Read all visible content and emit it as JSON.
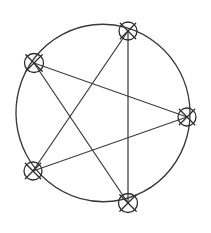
{
  "document": {
    "title": "Pentagram inscribed in circle",
    "background_color": "#ffffff",
    "width": 211,
    "height": 233
  },
  "figure": {
    "type": "geometric-diagram",
    "stroke_color": "#3a3a3a",
    "line_color": "#3f3f3f",
    "marker_color": "#2e2e2e",
    "stroke_width": 1.35,
    "circle": {
      "center_x": 103,
      "center_y": 113,
      "radius": 87
    },
    "vertices": [
      {
        "id": "top",
        "label": "A",
        "x": 128,
        "y": 31,
        "marker_radius": 9,
        "cross_length": 15
      },
      {
        "id": "upper-left",
        "label": "B",
        "x": 34,
        "y": 63,
        "marker_radius": 9.5,
        "cross_length": 16
      },
      {
        "id": "right",
        "label": "C",
        "x": 187,
        "y": 117,
        "marker_radius": 9,
        "cross_length": 15
      },
      {
        "id": "lower-left",
        "label": "D",
        "x": 33,
        "y": 171,
        "marker_radius": 9,
        "cross_length": 15
      },
      {
        "id": "bottom",
        "label": "E",
        "x": 128,
        "y": 203,
        "marker_radius": 9.5,
        "cross_length": 16
      }
    ],
    "chords": [
      {
        "id": "chord-top-to-lower-left",
        "from": "top",
        "to": "lower-left"
      },
      {
        "id": "chord-lower-left-to-right",
        "from": "lower-left",
        "to": "right"
      },
      {
        "id": "chord-right-to-upper-left",
        "from": "right",
        "to": "upper-left"
      },
      {
        "id": "chord-upper-left-to-bottom",
        "from": "upper-left",
        "to": "bottom"
      },
      {
        "id": "chord-bottom-to-top",
        "from": "bottom",
        "to": "top"
      }
    ]
  }
}
